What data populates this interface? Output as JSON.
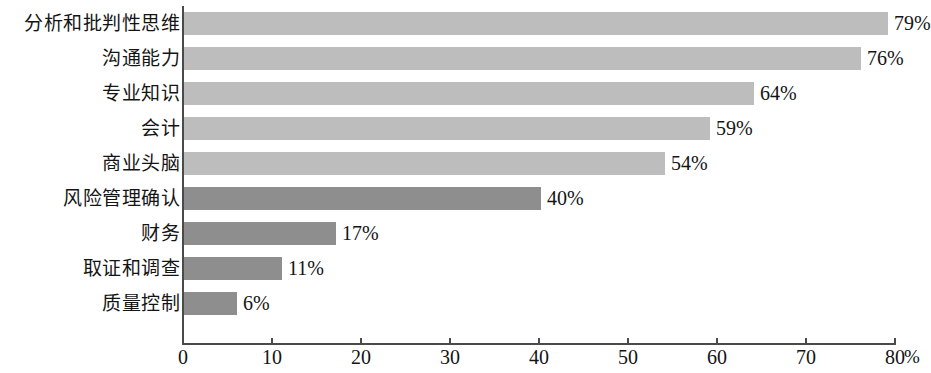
{
  "chart_data": {
    "type": "bar",
    "orientation": "horizontal",
    "title": "",
    "subtitle": "",
    "xlabel": "%",
    "ylabel": "",
    "xlim": [
      0,
      80
    ],
    "grid": false,
    "legend": null,
    "axis_unit_label": "%",
    "x_ticks": [
      0,
      10,
      20,
      30,
      40,
      50,
      60,
      70,
      80
    ],
    "x_tick_labels": [
      "0",
      "10",
      "20",
      "30",
      "40",
      "50",
      "60",
      "70",
      "80"
    ],
    "categories": [
      "分析和批判性思维",
      "沟通能力",
      "专业知识",
      "会计",
      "商业头脑",
      "风险管理确认",
      "财务",
      "取证和调查",
      "质量控制"
    ],
    "values": [
      79,
      76,
      64,
      59,
      54,
      40,
      17,
      11,
      6
    ],
    "value_labels": [
      "79%",
      "76%",
      "64%",
      "59%",
      "54%",
      "40%",
      "17%",
      "11%",
      "6%"
    ],
    "bar_colors": [
      "#bdbdbd",
      "#bdbdbd",
      "#bdbdbd",
      "#bdbdbd",
      "#bdbdbd",
      "#8e8e8e",
      "#8e8e8e",
      "#8e8e8e",
      "#8e8e8e"
    ],
    "colors": {
      "light_bar": "#bdbdbd",
      "dark_bar": "#8e8e8e",
      "axis": "#4a4a4a",
      "text": "#141414",
      "background": "#ffffff"
    }
  }
}
